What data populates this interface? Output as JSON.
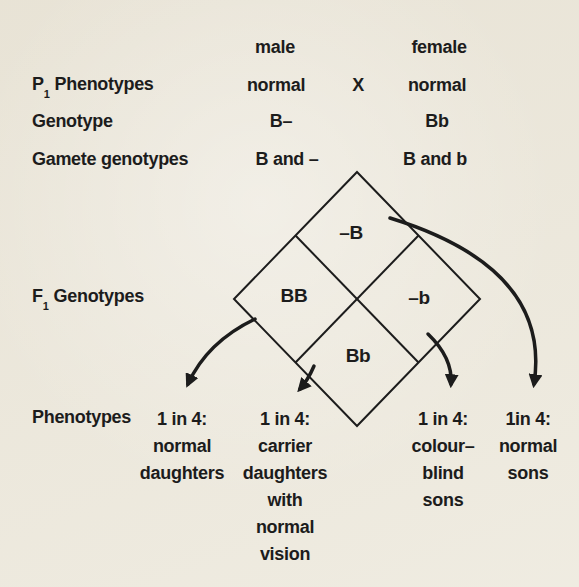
{
  "colors": {
    "paper": "#ede9dd",
    "ink": "#1c1c1c"
  },
  "parent_generation": {
    "male_header": "male",
    "female_header": "female",
    "cross_symbol": "X",
    "phenotype_row": {
      "label_base": "P",
      "label_sub": "1",
      "label_rest": "Phenotypes",
      "male_value": "normal",
      "female_value": "normal"
    },
    "genotype_row": {
      "label": "Genotype",
      "male_value": "B–",
      "female_value": "Bb"
    },
    "gamete_row": {
      "label": "Gamete genotypes",
      "male_value": "B and –",
      "female_value": "B and b"
    }
  },
  "f1_generation": {
    "label_base": "F",
    "label_sub": "1",
    "label_rest": "Genotypes",
    "punnett_cells": {
      "top": "–B",
      "left": "BB",
      "right": "–b",
      "bottom": "Bb"
    }
  },
  "phenotype_outcomes": {
    "label": "Phenotypes",
    "columns": [
      {
        "name": "normal-daughters",
        "lines": [
          "1 in 4:",
          "normal",
          "daughters"
        ]
      },
      {
        "name": "carrier-daughters",
        "lines": [
          "1 in 4:",
          "carrier",
          "daughters",
          "with",
          "normal",
          "vision"
        ]
      },
      {
        "name": "colour-blind-sons",
        "lines": [
          "1 in 4:",
          "colour–",
          "blind",
          "sons"
        ]
      },
      {
        "name": "normal-sons",
        "lines": [
          "1in 4:",
          "normal",
          "sons"
        ]
      }
    ]
  }
}
